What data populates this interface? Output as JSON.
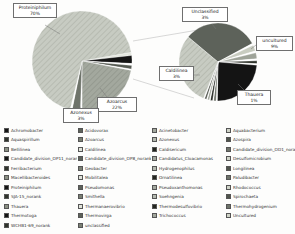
{
  "figure": {
    "background": "#fdfdfc",
    "accent_dark": "#141414",
    "accent_gray": "#5d625a",
    "accent_light": "#c7cbc2"
  },
  "chart_data": [
    {
      "type": "pie",
      "name": "main-community-pie",
      "center": [
        82,
        61
      ],
      "radius": 50,
      "start_angle": 10,
      "clockwise": true,
      "slices": [
        {
          "label": "",
          "value": 1.0,
          "color": "#e3e6de"
        },
        {
          "label": "",
          "value": 2.6,
          "color": "#141414"
        },
        {
          "label": "",
          "value": 0.6,
          "color": "#ffffff"
        },
        {
          "label": "",
          "value": 1.2,
          "color": "#555a52"
        },
        {
          "label": "",
          "value": 0.4,
          "color": "#ffffff"
        },
        {
          "label": "Azoarcus",
          "value": 22,
          "color": "#a3a89e",
          "hatch": "med"
        },
        {
          "label": "",
          "value": 0.5,
          "color": "#ffffff"
        },
        {
          "label": "Azonexus",
          "value": 2.7,
          "color": "#6e736a"
        },
        {
          "label": "",
          "value": 0.6,
          "color": "#ffffff"
        },
        {
          "label": "Proteiniphilum",
          "value": 68.4,
          "color": "#c7cbc2",
          "hatch": "light"
        }
      ]
    },
    {
      "type": "pie",
      "name": "expanded-minor-pie",
      "center": [
        218,
        62
      ],
      "radius": 39,
      "start_angle": 140,
      "clockwise": true,
      "slices": [
        {
          "label": "Unclassified",
          "value": 31,
          "color": "#5d625a"
        },
        {
          "label": "",
          "value": 0.8,
          "color": "#ffffff"
        },
        {
          "label": "uncultured",
          "value": 2.5,
          "color": "#c8ccc0"
        },
        {
          "label": "",
          "value": 0.8,
          "color": "#ffffff"
        },
        {
          "label": "",
          "value": 2.5,
          "color": "#9ea398"
        },
        {
          "label": "",
          "value": 0.8,
          "color": "#ffffff"
        },
        {
          "label": "",
          "value": 1.2,
          "color": "#30342c"
        },
        {
          "label": "",
          "value": 0.6,
          "color": "#ffffff"
        },
        {
          "label": "Thauera",
          "value": 24,
          "color": "#141414"
        },
        {
          "label": "",
          "value": 0.5,
          "color": "#ffffff"
        },
        {
          "label": "",
          "value": 1.0,
          "color": "#6e736a"
        },
        {
          "label": "",
          "value": 0.4,
          "color": "#ffffff"
        },
        {
          "label": "",
          "value": 1.0,
          "color": "#2a2d27"
        },
        {
          "label": "",
          "value": 0.4,
          "color": "#ffffff"
        },
        {
          "label": "",
          "value": 0.8,
          "color": "#9ea398"
        },
        {
          "label": "",
          "value": 0.4,
          "color": "#ffffff"
        },
        {
          "label": "",
          "value": 0.8,
          "color": "#50544c"
        },
        {
          "label": "",
          "value": 0.5,
          "color": "#ffffff"
        },
        {
          "label": "Caldilinea",
          "value": 30,
          "color": "#b5bab0",
          "hatch": "light"
        }
      ]
    }
  ],
  "callouts": [
    {
      "name": "Proteiniphilum",
      "pct": "70%",
      "x": 13,
      "y": 3,
      "w": 44,
      "leader": [
        45,
        25,
        60,
        34
      ]
    },
    {
      "name": "Azoarcus",
      "pct": "22%",
      "x": 97,
      "y": 97,
      "w": 40,
      "leader": [
        107,
        97,
        100,
        88
      ]
    },
    {
      "name": "Azonexus",
      "pct": "3%",
      "x": 63,
      "y": 108,
      "w": 36,
      "leader": [
        80,
        108,
        79,
        103
      ]
    },
    {
      "name": "Unclassified",
      "pct": "3%",
      "x": 182,
      "y": 7,
      "w": 46,
      "leader": [
        212,
        24,
        216,
        29
      ]
    },
    {
      "name": "uncultured",
      "pct": "9%",
      "x": 256,
      "y": 36,
      "w": 37,
      "leader": [
        256,
        45,
        251,
        49
      ]
    },
    {
      "name": "Caldilinea",
      "pct": "3%",
      "x": 159,
      "y": 66,
      "w": 35,
      "leader": [
        194,
        75,
        200,
        75
      ]
    },
    {
      "name": "Thauera",
      "pct": "1%",
      "x": 237,
      "y": 90,
      "w": 34,
      "leader": [
        244,
        90,
        238,
        84
      ]
    }
  ],
  "connector_lines": [
    {
      "x1": 133,
      "y1": 41,
      "x2": 198,
      "y2": 30
    },
    {
      "x1": 133,
      "y1": 79,
      "x2": 194,
      "y2": 98
    }
  ],
  "legend": {
    "items": [
      {
        "label": "Achromobacter",
        "color": "#141414"
      },
      {
        "label": "Acidovorax",
        "color": "#5d625a"
      },
      {
        "label": "Acinetobacter",
        "color": "#a3a89e"
      },
      {
        "label": "Aquabacterium",
        "color": "#d0d4c8"
      },
      {
        "label": "Aquaspirillum",
        "color": "#30342c"
      },
      {
        "label": "Azoarcus",
        "color": "#7b8074"
      },
      {
        "label": "Azonexus",
        "color": "#b5bab0"
      },
      {
        "label": "Azospira",
        "color": "#50544c"
      },
      {
        "label": "Bellilinea",
        "color": "#8b9084"
      },
      {
        "label": "Caldilinea",
        "color": "#e0e3da"
      },
      {
        "label": "Caldisericum",
        "color": "#23261f"
      },
      {
        "label": "Candidate_division_OD1_norank",
        "color": "#6e736a"
      },
      {
        "label": "Candidate_division_OP11_norank",
        "color": "#141414"
      },
      {
        "label": "Candidate_division_OP8_norank",
        "color": "#5d625a"
      },
      {
        "label": "Candidatus_Cloacamonas",
        "color": "#a3a89e"
      },
      {
        "label": "Desulfomicrobium",
        "color": "#d0d4c8"
      },
      {
        "label": "Ferribacterium",
        "color": "#30342c"
      },
      {
        "label": "Geobacter",
        "color": "#7b8074"
      },
      {
        "label": "Hydrogenophilus",
        "color": "#b5bab0"
      },
      {
        "label": "Longilinea",
        "color": "#50544c"
      },
      {
        "label": "Macellibacteroides",
        "color": "#8b9084"
      },
      {
        "label": "Mobilitalea",
        "color": "#e0e3da"
      },
      {
        "label": "Ornatilinea",
        "color": "#23261f"
      },
      {
        "label": "Paludibacter",
        "color": "#6e736a"
      },
      {
        "label": "Proteiniphilum",
        "color": "#141414"
      },
      {
        "label": "Pseudomonas",
        "color": "#5d625a"
      },
      {
        "label": "Pseudoxanthomonas",
        "color": "#a3a89e"
      },
      {
        "label": "Rhodococcus",
        "color": "#d0d4c8"
      },
      {
        "label": "SJA-15_norank",
        "color": "#30342c"
      },
      {
        "label": "Smithella",
        "color": "#7b8074"
      },
      {
        "label": "Soehngenia",
        "color": "#b5bab0"
      },
      {
        "label": "Spirochaeta",
        "color": "#50544c"
      },
      {
        "label": "Thauera",
        "color": "#8b9084"
      },
      {
        "label": "Thermanaerovibrio",
        "color": "#e0e3da"
      },
      {
        "label": "Thermodesulfovibrio",
        "color": "#23261f"
      },
      {
        "label": "Thermohydrogenium",
        "color": "#6e736a"
      },
      {
        "label": "Thermotoga",
        "color": "#141414"
      },
      {
        "label": "Thermovirga",
        "color": "#5d625a"
      },
      {
        "label": "Trichococcus",
        "color": "#a3a89e"
      },
      {
        "label": "Uncultured",
        "color": "#d0d4c8"
      },
      {
        "label": "WCHB1-69_norank",
        "color": "#30342c"
      },
      {
        "label": "unclassified",
        "color": "#7b8074"
      }
    ]
  }
}
